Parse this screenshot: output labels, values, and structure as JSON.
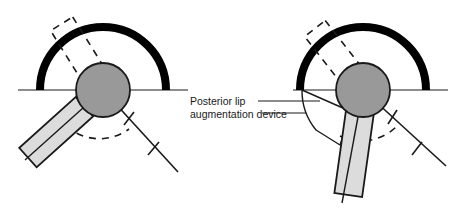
{
  "figure": {
    "background_color": "#ffffff",
    "width": 476,
    "height": 219
  },
  "colors": {
    "cup_black": "#000000",
    "femoral_head_fill": "#999999",
    "femoral_head_stroke": "#1a1a1a",
    "stem_fill": "#dcdcdc",
    "stem_stroke": "#1a1a1a",
    "device_fill": "#ffffff",
    "device_stroke": "#1a1a1a",
    "line_color": "#1a1a1a",
    "dashed_color": "#1a1a1a",
    "text_color": "#1a1a1a"
  },
  "annotation": {
    "label_line_1": "Posterior lip",
    "label_line_2": "augmentation device",
    "leader_line_count": 2
  },
  "panels": [
    {
      "id": "left-panel",
      "name": "standard-acetabular-cup-diagram",
      "has_augmentation_device": false,
      "cup": {
        "center_x": 103,
        "center_y": 90,
        "radius": 63,
        "stroke_width": 8,
        "arc_label": "acetabular-cup"
      },
      "baseline": {
        "x1": 18,
        "y1": 90,
        "x2": 188,
        "y2": 90
      },
      "femoral_head": {
        "center_x": 103,
        "center_y": 90,
        "radius": 27
      },
      "stem": {
        "angle_deg": 138,
        "length": 78,
        "width": 26,
        "label": "femoral-stem-neutral"
      },
      "ghost_stem": {
        "angle_deg": 58,
        "length": 78,
        "width": 26,
        "label": "femoral-stem-rotated-dashed"
      },
      "arc_of_motion": {
        "radius": 50,
        "start_deg": 138,
        "end_deg": 58
      }
    },
    {
      "id": "right-panel",
      "name": "augmented-acetabular-cup-diagram",
      "has_augmentation_device": true,
      "cup": {
        "center_x": 363,
        "center_y": 90,
        "radius": 63,
        "stroke_width": 8,
        "arc_label": "acetabular-cup"
      },
      "baseline": {
        "x1": 293,
        "y1": 90,
        "x2": 448,
        "y2": 90
      },
      "femoral_head": {
        "center_x": 363,
        "center_y": 90,
        "radius": 27
      },
      "stem": {
        "angle_deg": 98,
        "length": 86,
        "width": 26,
        "label": "femoral-stem-neutral"
      },
      "ghost_stem": {
        "angle_deg": 52,
        "length": 78,
        "width": 26,
        "label": "femoral-stem-rotated-dashed"
      },
      "arc_of_motion": {
        "radius": 50,
        "start_deg": 98,
        "end_deg": 52
      },
      "augmentation_device": {
        "apex_x": 340,
        "apex_y": 145,
        "label": "posterior-lip-augmentation-device"
      }
    }
  ]
}
